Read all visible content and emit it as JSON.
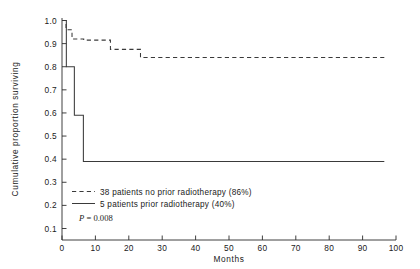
{
  "chart_data": {
    "type": "line",
    "title": "",
    "subtitle": "",
    "xlabel": "Months",
    "ylabel": "Cumulative proportion surviving",
    "xlim": [
      0,
      100
    ],
    "ylim": [
      0.0,
      1.0
    ],
    "xticks": [
      0,
      10,
      20,
      30,
      40,
      50,
      60,
      70,
      80,
      90,
      100
    ],
    "xtick_labels": [
      "0",
      "10",
      "20",
      "30",
      "40",
      "50",
      "60",
      "70",
      "80",
      "90",
      "100"
    ],
    "yticks": [
      0.1,
      0.2,
      0.3,
      0.4,
      0.5,
      0.6,
      0.7,
      0.8,
      0.9,
      1.0
    ],
    "ytick_labels": [
      "0.1",
      "0.2",
      "0.3",
      "0.4",
      "0.5",
      "0.6",
      "0.7",
      "0.8",
      "0.9",
      "1.0"
    ],
    "grid": false,
    "legend_position": "lower-left-inside",
    "step_style": "post",
    "annotation": "P = 0.008",
    "series": [
      {
        "name": "38 patients no prior radiotherapy (86%)",
        "style": "dashed",
        "color": "#3a3a3a",
        "n_patients": 38,
        "survival_percent": 86,
        "x": [
          0.0,
          1.2,
          1.2,
          3.0,
          3.0,
          6.5,
          6.5,
          14.5,
          14.5,
          23.5,
          23.5,
          96.5
        ],
        "y": [
          1.0,
          1.0,
          0.96,
          0.96,
          0.92,
          0.92,
          0.915,
          0.915,
          0.875,
          0.875,
          0.84,
          0.84
        ]
      },
      {
        "name": "5 patients prior radiotherapy (40%)",
        "style": "solid",
        "color": "#3a3a3a",
        "n_patients": 5,
        "survival_percent": 40,
        "x": [
          0.0,
          1.3,
          1.3,
          3.7,
          3.7,
          6.4,
          6.4,
          96.5
        ],
        "y": [
          1.0,
          1.0,
          0.8,
          0.8,
          0.59,
          0.59,
          0.39,
          0.39
        ]
      }
    ]
  },
  "legend": {
    "entries": [
      {
        "label": "38 patients no prior radiotherapy (86%)",
        "style": "dashed"
      },
      {
        "label": "5 patients prior radiotherapy (40%)",
        "style": "solid"
      }
    ],
    "pvalue_prefix": "P",
    "pvalue_rest": " = 0.008"
  }
}
